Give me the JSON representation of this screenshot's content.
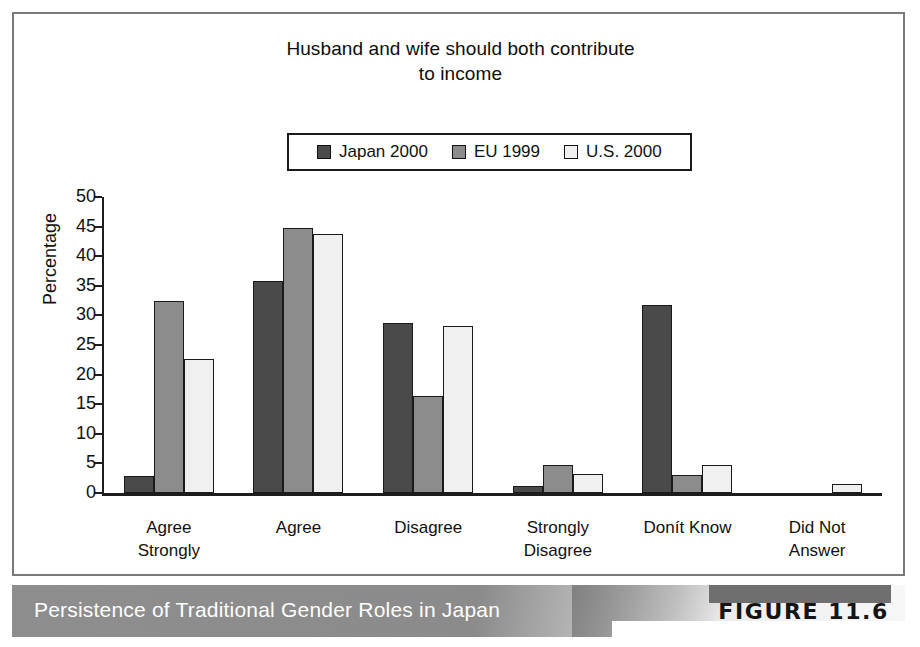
{
  "figure": {
    "caption": "Persistence of Traditional Gender Roles in Japan",
    "tag": "FIGURE 11.6"
  },
  "chart_data": {
    "type": "bar",
    "title": "Husband and wife should both contribute to income",
    "title_lines": [
      "Husband and wife should both contribute",
      "to income"
    ],
    "xlabel": "",
    "ylabel": "Percentage",
    "ylim": [
      0,
      50
    ],
    "yticks": [
      0,
      5,
      10,
      15,
      20,
      25,
      30,
      35,
      40,
      45,
      50
    ],
    "ytick_labels": [
      "0",
      "5",
      "10",
      "15",
      "20",
      "25",
      "30",
      "35",
      "40",
      "45",
      "50"
    ],
    "grid": false,
    "legend_position": "top-center",
    "categories": [
      "Agree Strongly",
      "Agree",
      "Disagree",
      "Strongly Disagree",
      "Donít Know",
      "Did Not Answer"
    ],
    "category_lines": [
      [
        "Agree",
        "Strongly"
      ],
      [
        "Agree"
      ],
      [
        "Disagree"
      ],
      [
        "Strongly",
        "Disagree"
      ],
      [
        "Donít Know"
      ],
      [
        "Did Not",
        "Answer"
      ]
    ],
    "series": [
      {
        "name": "Japan 2000",
        "color": "#4a4a4a",
        "values": [
          2.8,
          35.8,
          28.8,
          1.2,
          31.7,
          0.0
        ]
      },
      {
        "name": "EU 1999",
        "color": "#8c8c8c",
        "values": [
          32.4,
          44.8,
          16.4,
          4.8,
          3.1,
          0.0
        ]
      },
      {
        "name": "U.S. 2000",
        "color": "#f0f0f0",
        "values": [
          22.7,
          43.8,
          28.2,
          3.2,
          4.8,
          1.5
        ]
      }
    ]
  }
}
